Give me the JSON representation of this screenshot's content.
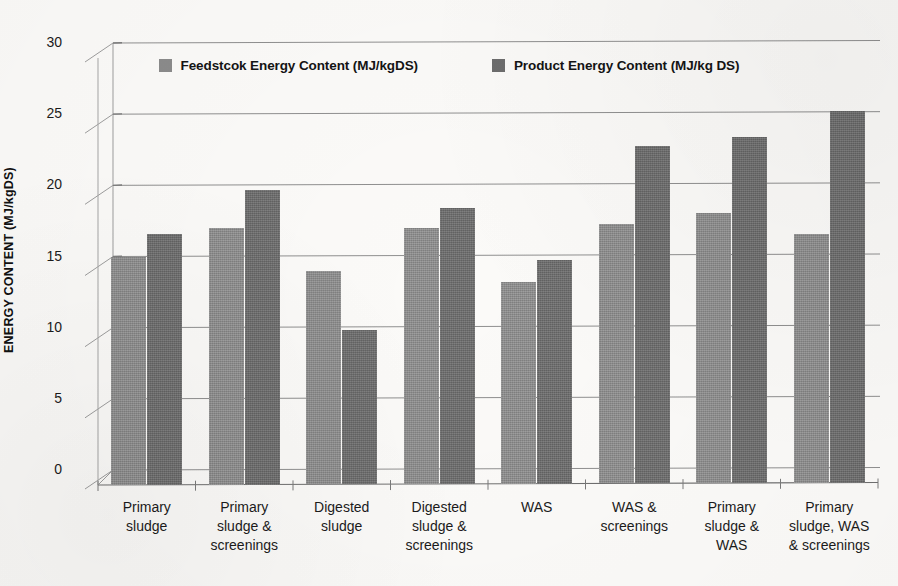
{
  "chart_data": {
    "type": "bar",
    "title": "",
    "xlabel": "",
    "ylabel": "ENERGY CONTENT (MJ/kgDS)",
    "ylim": [
      0,
      30
    ],
    "yticks": [
      0,
      5,
      10,
      15,
      20,
      25,
      30
    ],
    "grid": true,
    "legend_position": "top-center",
    "categories": [
      "Primary sludge",
      "Primary sludge & screenings",
      "Digested sludge",
      "Digested sludge & screenings",
      "WAS",
      "WAS & screenings",
      "Primary sludge & WAS",
      "Primary sludge, WAS & screenings"
    ],
    "category_lines": [
      [
        "Primary",
        "sludge"
      ],
      [
        "Primary",
        "sludge &",
        "screenings"
      ],
      [
        "Digested",
        "sludge"
      ],
      [
        "Digested",
        "sludge &",
        "screenings"
      ],
      [
        "WAS"
      ],
      [
        "WAS &",
        "screenings"
      ],
      [
        "Primary",
        "sludge &",
        "WAS"
      ],
      [
        "Primary",
        "sludge, WAS",
        "& screenings"
      ]
    ],
    "series": [
      {
        "name": "Feedstcok Energy Content (MJ/kgDS)",
        "color": "#8b8b8b",
        "values": [
          16.0,
          18.0,
          15.0,
          18.0,
          14.2,
          18.2,
          19.0,
          17.5
        ]
      },
      {
        "name": "Product Energy Content (MJ/kg DS)",
        "color": "#6d6d6d",
        "values": [
          17.6,
          20.7,
          10.8,
          19.4,
          15.7,
          23.7,
          24.3,
          26.1
        ]
      }
    ]
  },
  "axis": {
    "y_title": "ENERGY CONTENT (MJ/kgDS)",
    "y_tick_labels": [
      "30",
      "25",
      "20",
      "15",
      "10",
      "5",
      "0"
    ]
  },
  "legend": {
    "entries": [
      {
        "label": "Feedstcok Energy Content (MJ/kgDS)",
        "swatch": "legend-swatch-feedstock"
      },
      {
        "label": "Product Energy Content (MJ/kg DS)",
        "swatch": "legend-swatch-product"
      }
    ]
  }
}
